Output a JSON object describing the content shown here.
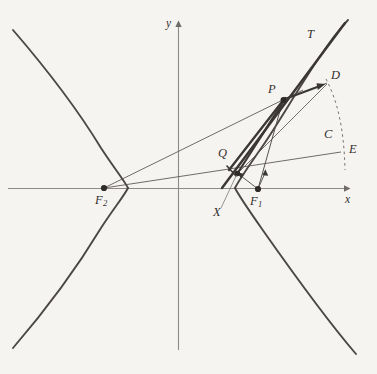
{
  "figure": {
    "kind": "hyperbola-reflection-diagram",
    "background_color": "#f6f4f1",
    "stroke_color": "#4a4745",
    "thick_stroke_color": "#3a3735",
    "axis_color": "#8d8a87"
  },
  "axes": {
    "x_label": "x",
    "y_label": "y",
    "origin": {
      "x": 178,
      "y": 188
    }
  },
  "points": [
    {
      "id": "F2",
      "label": "F",
      "subscript": "2",
      "x": 104,
      "y": 188,
      "dot": true
    },
    {
      "id": "F1",
      "label": "F",
      "subscript": "1",
      "x": 258,
      "y": 189,
      "dot": true
    },
    {
      "id": "P",
      "label": "P",
      "subscript": "",
      "x": 283,
      "y": 100,
      "dot": true
    },
    {
      "id": "Q",
      "label": "Q",
      "subscript": "",
      "x": 232,
      "y": 163,
      "dot": false
    },
    {
      "id": "X",
      "label": "X",
      "subscript": "",
      "x": 238,
      "y": 173,
      "dot": true
    },
    {
      "id": "D",
      "label": "D",
      "subscript": "",
      "x": 327,
      "y": 82,
      "dot": false
    },
    {
      "id": "T",
      "label": "T",
      "subscript": "",
      "x": 313,
      "y": 35,
      "dot": false
    },
    {
      "id": "C",
      "label": "C",
      "subscript": "",
      "x": 330,
      "y": 136,
      "dot": false
    },
    {
      "id": "E",
      "label": "E",
      "subscript": "",
      "x": 341,
      "y": 152,
      "dot": false
    }
  ],
  "labels": {
    "F2": "F",
    "F2_sub": "2",
    "F1": "F",
    "F1_sub": "1",
    "P": "P",
    "Q": "Q",
    "X": "X",
    "D": "D",
    "T": "T",
    "C": "C",
    "E": "E",
    "x_axis": "x",
    "y_axis": "y"
  }
}
